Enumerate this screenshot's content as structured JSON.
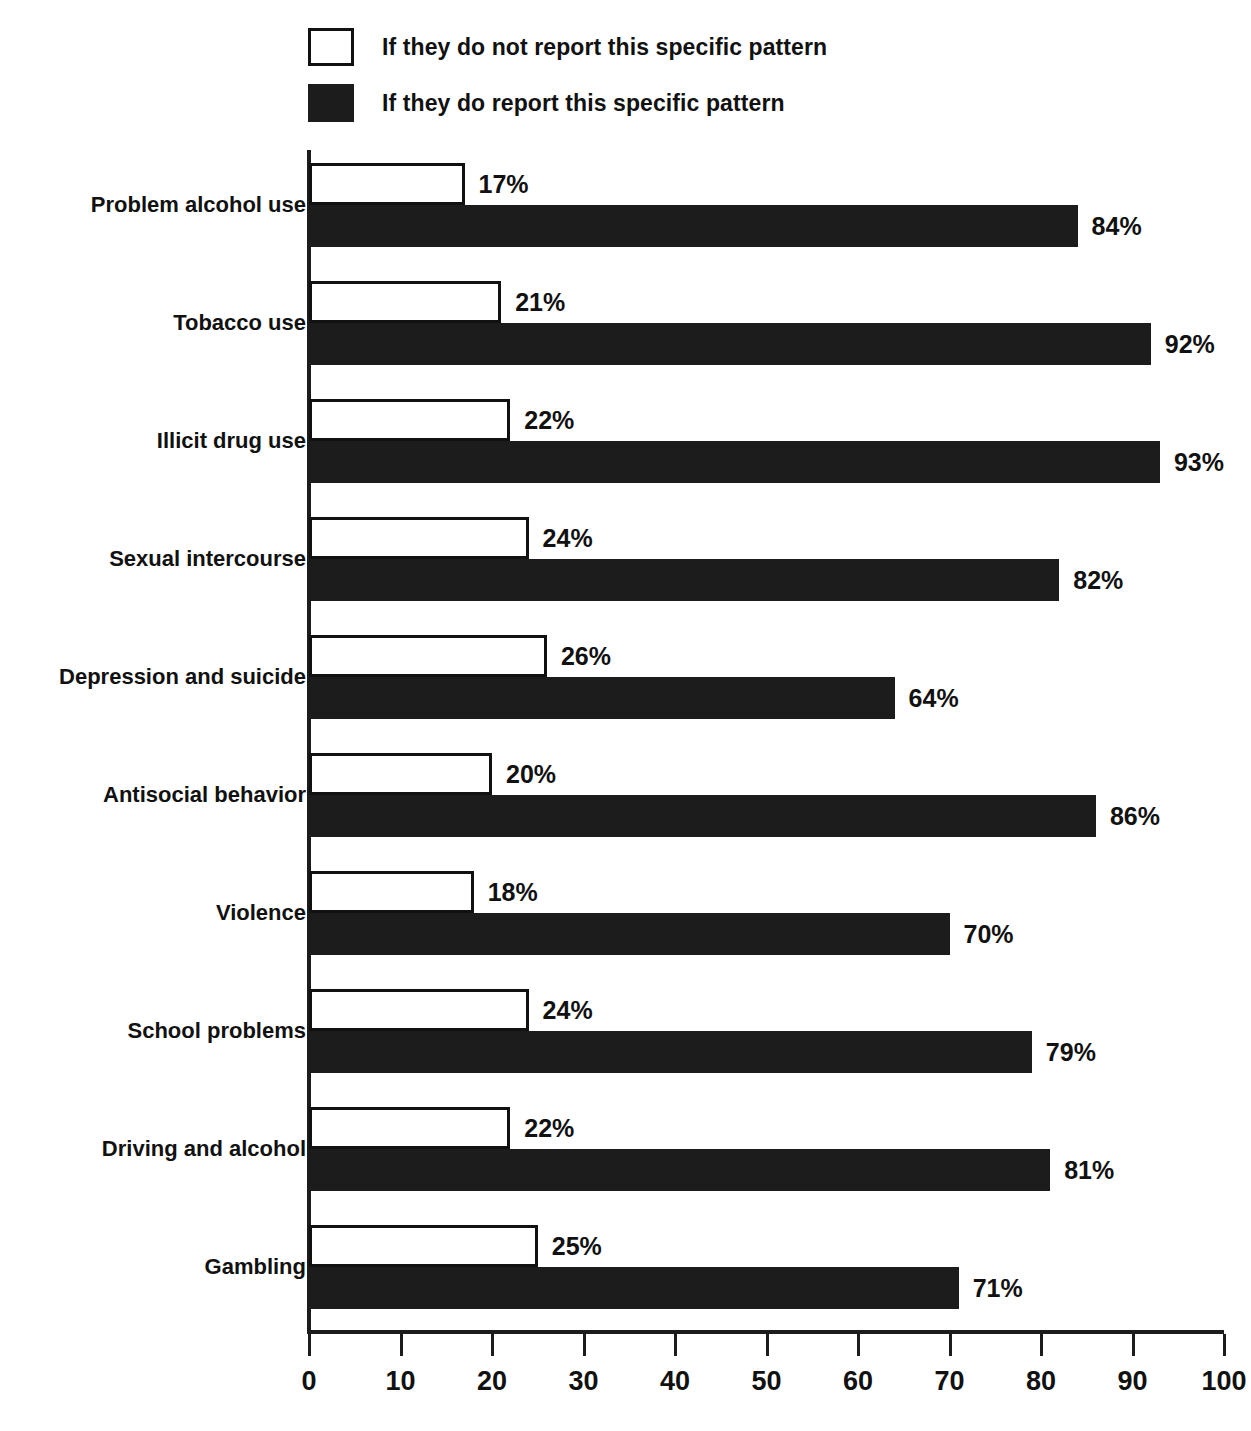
{
  "legend": {
    "entries": [
      {
        "swatch": "empty-square-icon",
        "label": "If they do not report this specific pattern"
      },
      {
        "swatch": "filled-square-icon",
        "label": "If they do report this specific pattern"
      }
    ]
  },
  "colors": {
    "bar_dark": "#1c1c1c",
    "bar_light": "#ffffff",
    "outline": "#111111",
    "text": "#111111",
    "background": "#ffffff"
  },
  "chart_data": {
    "type": "bar",
    "orientation": "horizontal",
    "title": "",
    "subtitle": "",
    "xlabel": "",
    "ylabel": "",
    "xlim": [
      0,
      100
    ],
    "xticks": [
      0,
      10,
      20,
      30,
      40,
      50,
      60,
      70,
      80,
      90,
      100
    ],
    "xtick_labels": [
      "0",
      "10",
      "20",
      "30",
      "40",
      "50",
      "60",
      "70",
      "80",
      "90",
      "100"
    ],
    "grid": false,
    "legend_position": "top-left",
    "value_suffix": "%",
    "categories": [
      "Problem alcohol use",
      "Tobacco use",
      "Illicit drug use",
      "Sexual intercourse",
      "Depression and suicide",
      "Antisocial behavior",
      "Violence",
      "School problems",
      "Driving and alcohol",
      "Gambling"
    ],
    "series": [
      {
        "name": "If they do not report this specific pattern",
        "style": "light",
        "values": [
          17,
          21,
          22,
          24,
          26,
          20,
          18,
          24,
          22,
          25
        ],
        "labels": [
          "17%",
          "21%",
          "22%",
          "24%",
          "26%",
          "20%",
          "18%",
          "24%",
          "22%",
          "25%"
        ]
      },
      {
        "name": "If they do report this specific pattern",
        "style": "dark",
        "values": [
          84,
          92,
          93,
          82,
          64,
          86,
          70,
          79,
          81,
          71
        ],
        "labels": [
          "84%",
          "92%",
          "93%",
          "82%",
          "64%",
          "86%",
          "70%",
          "79%",
          "81%",
          "71%"
        ]
      }
    ]
  }
}
